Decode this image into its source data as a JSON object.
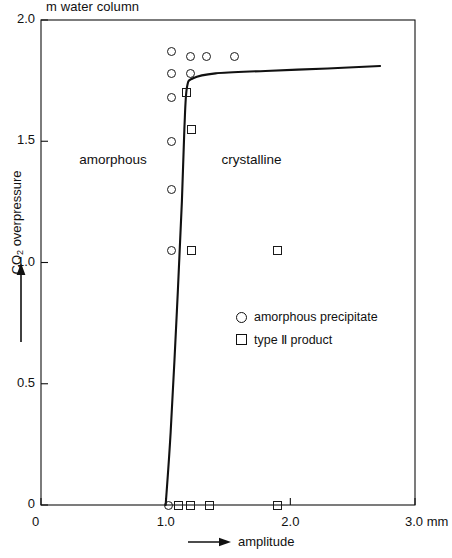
{
  "chart_data": {
    "type": "scatter",
    "title": "",
    "unit_label": "m water column",
    "xlabel": "amplitude",
    "ylabel": "CO2 overpressure",
    "ylabel_html": "CO<sub>2</sub> overpressure",
    "x_unit": "mm",
    "xlim": [
      0,
      3.0
    ],
    "ylim": [
      0,
      2.0
    ],
    "xticks": [
      0,
      1.0,
      2.0,
      3.0
    ],
    "xticklabels": [
      "0",
      "1.0",
      "2.0",
      "3.0"
    ],
    "yticks": [
      0,
      0.5,
      1.0,
      1.5,
      2.0
    ],
    "yticklabels": [
      "0",
      "0.5",
      "1.0",
      "1.5",
      "2.0"
    ],
    "grid": false,
    "legend_position": "center-right",
    "series": [
      {
        "name": "amorphous precipitate",
        "marker": "circle",
        "points": [
          [
            1.05,
            1.87
          ],
          [
            1.2,
            1.85
          ],
          [
            1.33,
            1.85
          ],
          [
            1.55,
            1.85
          ],
          [
            1.05,
            1.78
          ],
          [
            1.2,
            1.78
          ],
          [
            1.05,
            1.68
          ],
          [
            1.05,
            1.5
          ],
          [
            1.05,
            1.3
          ],
          [
            1.05,
            1.05
          ],
          [
            1.02,
            0.0
          ]
        ]
      },
      {
        "name": "type II product",
        "marker": "square",
        "points": [
          [
            1.17,
            1.7
          ],
          [
            1.21,
            1.55
          ],
          [
            1.21,
            1.05
          ],
          [
            1.9,
            1.05
          ],
          [
            1.1,
            0.0
          ],
          [
            1.2,
            0.0
          ],
          [
            1.35,
            0.0
          ],
          [
            1.9,
            0.0
          ]
        ]
      }
    ],
    "boundary_curve": {
      "name": "phase boundary",
      "points": [
        [
          1.0,
          0.0
        ],
        [
          1.04,
          0.3
        ],
        [
          1.09,
          0.8
        ],
        [
          1.13,
          1.25
        ],
        [
          1.15,
          1.55
        ],
        [
          1.17,
          1.72
        ],
        [
          1.22,
          1.76
        ],
        [
          1.4,
          1.78
        ],
        [
          1.8,
          1.79
        ],
        [
          2.3,
          1.8
        ],
        [
          2.72,
          1.81
        ]
      ]
    },
    "annotations": [
      {
        "text": "amorphous",
        "x": 0.58,
        "y": 1.42
      },
      {
        "text": "crystalline",
        "x": 1.72,
        "y": 1.42
      }
    ],
    "legend": [
      {
        "marker": "circle",
        "label": "amorphous precipitate"
      },
      {
        "marker": "square",
        "label": "type Ⅱ product"
      }
    ]
  }
}
